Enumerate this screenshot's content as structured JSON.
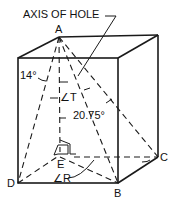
{
  "diagram": {
    "title_label": "AXIS OF HOLE",
    "points": {
      "A": "A",
      "B": "B",
      "C": "C",
      "D": "D",
      "E": "E"
    },
    "angles": {
      "left": "14°",
      "T": "∠T",
      "main": "20.75°",
      "R": "∠R"
    },
    "colors": {
      "line": "#1a1a1a",
      "background": "#ffffff"
    }
  }
}
